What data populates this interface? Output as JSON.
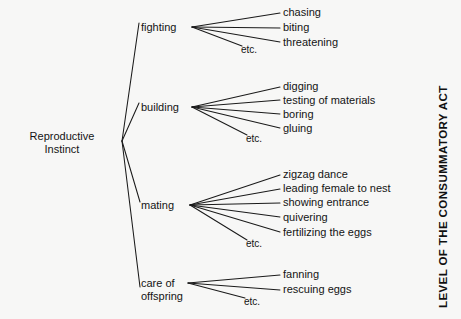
{
  "figure": {
    "background_color": "#f7f7f6",
    "ink_color": "#141414",
    "axis_label": "LEVEL OF THE CONSUMMATORY ACT",
    "etc_label": "etc."
  },
  "diagram": {
    "type": "tree",
    "orientation": "left-to-right",
    "root": {
      "label_line1": "Reproductive",
      "label_line2": "Instinct"
    },
    "branches": [
      {
        "id": "fighting",
        "label_line1": "fighting",
        "label_line2": "",
        "leaves": [
          "chasing",
          "biting",
          "threatening"
        ],
        "has_etc": true
      },
      {
        "id": "building",
        "label_line1": "building",
        "label_line2": "",
        "leaves": [
          "digging",
          "testing of materials",
          "boring",
          "gluing"
        ],
        "has_etc": true
      },
      {
        "id": "mating",
        "label_line1": "mating",
        "label_line2": "",
        "leaves": [
          "zigzag dance",
          "leading female to nest",
          "showing entrance",
          "quivering",
          "fertilizing the eggs"
        ],
        "has_etc": true
      },
      {
        "id": "care-of-offspring",
        "label_line1": "care of",
        "label_line2": "offspring",
        "leaves": [
          "fanning",
          "rescuing eggs"
        ],
        "has_etc": true
      }
    ]
  }
}
